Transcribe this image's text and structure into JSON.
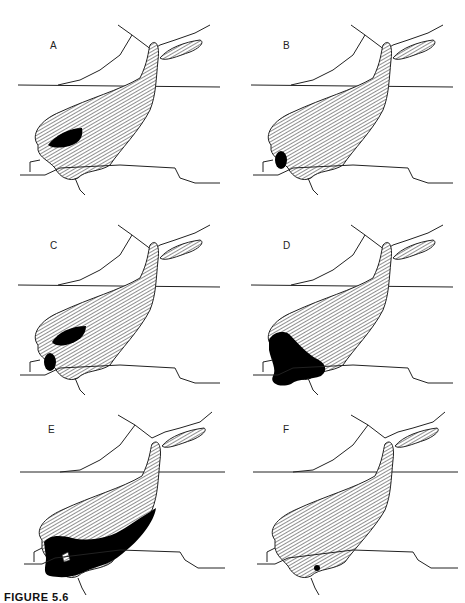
{
  "figure": {
    "caption": "FIGURE 5.6",
    "panels": [
      {
        "label": "A",
        "highlight": "upper-left dark region along northwest shore"
      },
      {
        "label": "B",
        "highlight": "small dark oval at western end"
      },
      {
        "label": "C",
        "highlight": "two dark regions: northwest shore and western end"
      },
      {
        "label": "D",
        "highlight": "dark region across western end and southern lobe"
      },
      {
        "label": "E",
        "highlight": "large dark region covering most of southern half"
      },
      {
        "label": "F",
        "highlight": "tiny dark spot near southern edge"
      }
    ]
  }
}
